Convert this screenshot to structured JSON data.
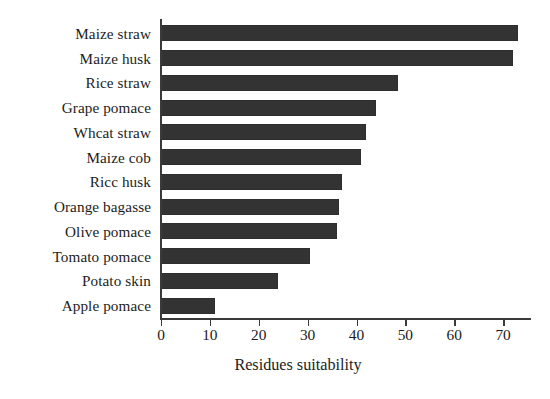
{
  "chart_data": {
    "type": "bar",
    "orientation": "horizontal",
    "title": "",
    "xlabel": "Residues suitability",
    "ylabel": "",
    "categories": [
      "Maize straw",
      "Maize husk",
      "Rice straw",
      "Grape pomace",
      "Whcat straw",
      "Maize cob",
      "Ricc husk",
      "Orange bagasse",
      "Olive pomace",
      "Tomato pomace",
      "Potato skin",
      "Apple pomace"
    ],
    "values": [
      73,
      72,
      48.5,
      44,
      42,
      41,
      37,
      36.5,
      36,
      30.5,
      24,
      11
    ],
    "xlim": [
      0,
      75.5
    ],
    "xticks": [
      0,
      10,
      20,
      30,
      40,
      50,
      60,
      70
    ],
    "xtick_labels": [
      "0",
      "10",
      "20",
      "30",
      "40",
      "50",
      "60",
      "70"
    ],
    "grid": false,
    "legend": null,
    "bar_color": "#333333",
    "axis_color": "#3a3a3a",
    "background_color": "#ffffff"
  }
}
